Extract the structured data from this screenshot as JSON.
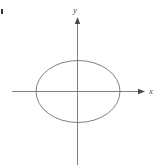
{
  "figure": {
    "background_color": "#ffffff",
    "stroke_color": "#808080",
    "axis_color": "#808080",
    "label_color": "#4d4d4d",
    "corner_mark_color": "#3a3a3a"
  },
  "axes": {
    "x_label": "x",
    "y_label": "y",
    "x_axis": {
      "start_x": 12,
      "end_x": 145,
      "y": 91,
      "arrow": "right"
    },
    "y_axis": {
      "x": 77.5,
      "start_y": 165,
      "end_y": 18,
      "arrow": "up"
    }
  },
  "chart_data": {
    "type": "line",
    "xlabel": "x",
    "ylabel": "y",
    "grid": false,
    "legend": "none",
    "shapes": [
      {
        "name": "ellipse",
        "kind": "ellipse",
        "center": [
          0,
          0
        ],
        "semi_axis_x": 42,
        "semi_axis_y": 31,
        "stroke": "#808080",
        "fill": "none",
        "stroke_width": 1
      }
    ],
    "pixel_geometry": {
      "center": [
        78,
        91.5
      ],
      "radius_x": 42,
      "radius_y": 31,
      "x_extent": [
        36,
        120
      ],
      "y_extent": [
        60.5,
        122.5
      ]
    },
    "x": [],
    "values": []
  }
}
